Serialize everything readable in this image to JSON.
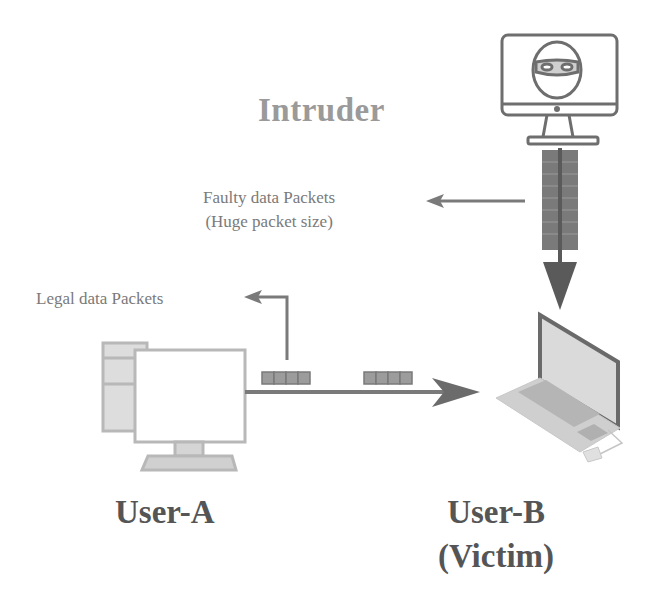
{
  "labels": {
    "intruder": "Intruder",
    "faulty_line1": "Faulty data Packets",
    "faulty_line2": "(Huge packet size)",
    "legal": "Legal data Packets",
    "user_a": "User-A",
    "user_b_line1": "User-B",
    "user_b_line2": "(Victim)"
  },
  "icons": {
    "intruder": "masked-intruder-monitor-icon",
    "user_a": "desktop-computer-icon",
    "user_b": "laptop-icon"
  },
  "colors": {
    "text_light": "#9a9a9a",
    "text_dark": "#555555",
    "arrow": "#6b6b6b",
    "packet": "#8a8a8a",
    "device_fill": "#dcdcdc"
  }
}
